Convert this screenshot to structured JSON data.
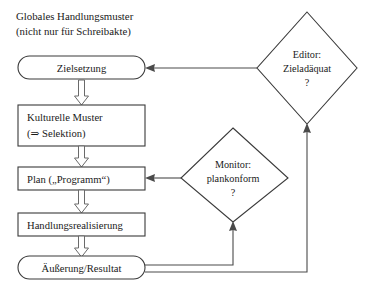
{
  "diagram": {
    "title": {
      "line1": "Globales Handlungsmuster",
      "line2": "(nicht nur für Schreibakte)"
    },
    "nodes": {
      "zielsetzung": {
        "label": "Zielsetzung",
        "shape": "stadium"
      },
      "kulturelle_muster": {
        "line1": "Kulturelle Muster",
        "line2": "(⇒ Selektion)",
        "shape": "rect"
      },
      "plan": {
        "label": "Plan („Programm“)",
        "shape": "rect"
      },
      "handlungsrealisierung": {
        "label": "Handlungsrealisierung",
        "shape": "rect"
      },
      "aeusserung": {
        "label": "Äußerung/Resultat",
        "shape": "stadium"
      }
    },
    "decisions": {
      "editor": {
        "line1": "Editor:",
        "line2": "Zieladäquat",
        "line3": "?"
      },
      "monitor": {
        "line1": "Monitor:",
        "line2": "plankonform",
        "line3": "?"
      }
    },
    "colors": {
      "stroke": "#3a3a3a",
      "connector": "#4a4a4a",
      "block_arrow_stroke": "#6a6a6a",
      "fill": "#ffffff",
      "text": "#1a1a1a"
    }
  }
}
